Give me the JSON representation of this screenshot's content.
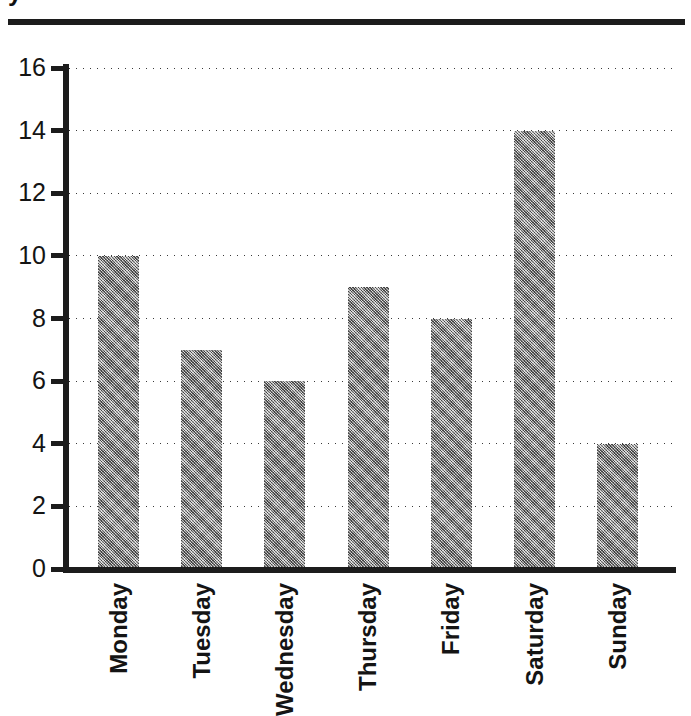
{
  "figure": {
    "title_cropped": "y",
    "rule_color": "#1c1c1c",
    "bar_color": "#8f8f8f",
    "axis_color": "#1c1c1c",
    "background": "#ffffff"
  },
  "chart_data": {
    "type": "bar",
    "title": "",
    "xlabel": "",
    "ylabel": "",
    "categories": [
      "Monday",
      "Tuesday",
      "Wednesday",
      "Thursday",
      "Friday",
      "Saturday",
      "Sunday"
    ],
    "values": [
      10,
      7,
      6,
      9,
      8,
      14,
      4
    ],
    "ylim": [
      0,
      16
    ],
    "yticks": [
      0,
      2,
      4,
      6,
      8,
      10,
      12,
      14,
      16
    ],
    "ytick_labels": [
      "0",
      "2",
      "4",
      "6",
      "8",
      "10",
      "12",
      "14",
      "16"
    ],
    "grid": true,
    "grid_style": "dotted",
    "grid_axis": "y",
    "legend": false,
    "xtick_rotation": 90,
    "series": [
      {
        "name": "",
        "values": [
          10,
          7,
          6,
          9,
          8,
          14,
          4
        ]
      }
    ]
  }
}
